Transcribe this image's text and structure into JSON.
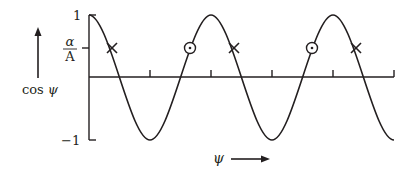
{
  "diagram": {
    "type": "cosine-wave",
    "y_axis": {
      "label": "cos ψ",
      "label_func": "cos",
      "label_var": "ψ",
      "tick_labels": {
        "top": "1",
        "bottom": "−1",
        "threshold_numerator": "α",
        "threshold_denominator": "A"
      }
    },
    "x_axis": {
      "label": "ψ",
      "tick_count": 5
    },
    "markers": {
      "cross": {
        "symbol": "×",
        "meaning": "downward crossing of α/A",
        "count": 3
      },
      "dot": {
        "symbol": "⊙",
        "meaning": "upward crossing of α/A",
        "count": 2
      }
    },
    "colors": {
      "line": "#231f20",
      "background": "#ffffff"
    }
  }
}
